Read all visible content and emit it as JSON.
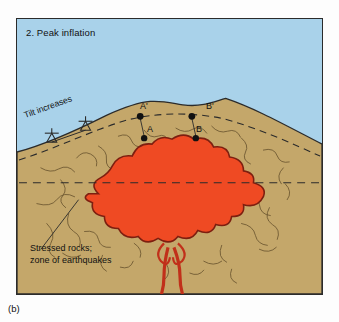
{
  "figure": {
    "caption": "(b)",
    "panel_title": "2. Peak inflation",
    "colors": {
      "sky": "#a9d2ea",
      "ground": "#c4a76a",
      "magma": "#ef4a23",
      "magma_outline": "#7d1f10",
      "crack": "#6b5530",
      "border": "#2b2b2b",
      "text": "#111111"
    },
    "labels": {
      "a_prime": "A'",
      "b_prime": "B'",
      "a": "A",
      "b": "B",
      "tilt": "Tilt increases",
      "stressed_line1": "Stressed rocks;",
      "stressed_line2": "zone of earthquakes"
    },
    "elements": {
      "sky_region": "sky-background",
      "ground_region": "ground-cross-section",
      "magma_chamber": "magma-chamber",
      "conduit": "magma-conduit",
      "surface_profile": "inflated-ground-surface",
      "dashed_pre_inflation": "pre-inflation-surface-dashed",
      "dashed_horizontal": "horizontal-reference-dashed",
      "tiltmeter_left": "tiltmeter-symbol-left",
      "tiltmeter_right": "tiltmeter-symbol-right",
      "leader_line": "stressed-rocks-leader-line"
    }
  }
}
